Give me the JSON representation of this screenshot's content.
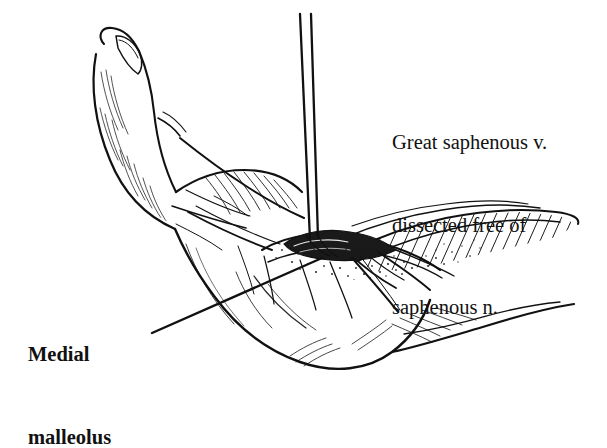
{
  "figure": {
    "kind": "medical-line-illustration",
    "background_color": "#ffffff",
    "ink_color": "#111111",
    "width": 607,
    "height": 432
  },
  "labels": {
    "vein": {
      "name": "great-saphenous-vein-label",
      "lines": [
        "Great saphenous v.",
        "dissected free of",
        "saphenous n."
      ],
      "bold": false
    },
    "malleolus": {
      "name": "medial-malleolus-label",
      "lines": [
        "Medial",
        "malleolus"
      ],
      "bold": true
    }
  },
  "leaders": {
    "malleolus_leader": {
      "from_x": 152,
      "from_y": 333,
      "to_x": 322,
      "to_y": 258
    },
    "vein_pointer": {
      "note": "instrument shafts descend from top of frame into the wound",
      "from_x": 303,
      "from_y": 14,
      "to_x": 312,
      "to_y": 243
    }
  },
  "anatomy_parts": [
    "great-toe",
    "dorsum-of-foot",
    "medial-malleolus",
    "heel",
    "achilles-region",
    "retracted-skin-flap",
    "dissection-wound",
    "saphenous-vein-branches"
  ]
}
